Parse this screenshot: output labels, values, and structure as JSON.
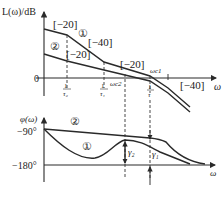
{
  "magnitude_plot": {
    "ylabel": "L(ω)/dB",
    "xlabel": "ω",
    "zero_label": "0",
    "curve_labels": {
      "c1": "①",
      "c2": "②"
    },
    "slope_labels": [
      "[−20]",
      "[−40]",
      "[−20]",
      "[−20]",
      "[−40]"
    ],
    "freq_ticks": {
      "tau2": {
        "num": "1",
        "den": "τ₂"
      },
      "tau1": {
        "num": "1",
        "den": "τ₁"
      },
      "tau": {
        "num": "1",
        "den": "τ"
      }
    },
    "crossover_labels": {
      "wc2": "ωc2",
      "wc1": "ωc1"
    }
  },
  "phase_plot": {
    "ylabel": "φ(ω)",
    "xlabel": "ω",
    "ticks": [
      "−90°",
      "−180°"
    ],
    "curve_labels": {
      "c1": "①",
      "c2": "②"
    },
    "margin_labels": {
      "gamma2": "γ₂",
      "gamma1": "γ₁"
    }
  }
}
